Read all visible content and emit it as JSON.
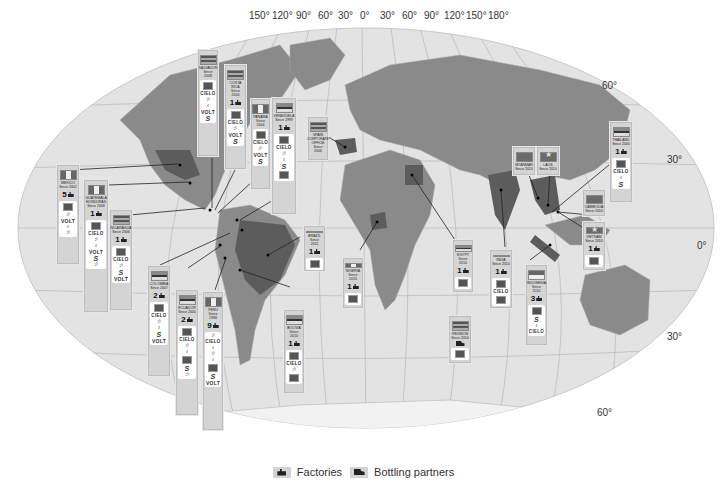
{
  "map": {
    "projection": "world-oval",
    "longitude_labels_top": [
      "150°",
      "120°",
      "90°",
      "60°",
      "30°",
      "0°",
      "30°",
      "60°",
      "90°",
      "120°",
      "150°",
      "180°"
    ],
    "latitude_labels_right": [
      "60°",
      "30°",
      "0°",
      "30°",
      "60°"
    ],
    "colors": {
      "ocean": "#e3e3e3",
      "land": "#8a8a8a",
      "highlight_land": "#5c5c5c",
      "card_bg": "#d4d4d4",
      "graticule": "#b8b8b8"
    }
  },
  "countries": [
    {
      "id": "salvador",
      "name": "SALVADOR",
      "since": "Since 2008",
      "count": "",
      "brands": [
        "logo",
        "CIELO",
        "script",
        "script",
        "VOLT",
        "S",
        "script"
      ]
    },
    {
      "id": "costa-rica",
      "name": "COSTA RICA",
      "since": "Since 2004",
      "count": "1",
      "brands": [
        "logo",
        "CIELO",
        "script",
        "script",
        "VOLT",
        "S"
      ]
    },
    {
      "id": "panama",
      "name": "PANAMA",
      "since": "Since 2004",
      "count": "",
      "brands": [
        "logo",
        "CIELO",
        "script",
        "script",
        "VOLT",
        "S"
      ]
    },
    {
      "id": "venezuela",
      "name": "VENEZUELA",
      "since": "Since 1999",
      "count": "1",
      "brands": [
        "logo",
        "CIELO",
        "script",
        "script",
        "script",
        "S",
        "box"
      ]
    },
    {
      "id": "spain",
      "name": "SPAIN Corporate office",
      "since": "Since 2006",
      "count": "",
      "brands": []
    },
    {
      "id": "mexico",
      "name": "MEXICO",
      "since": "Since 2002",
      "count": "5",
      "brands": [
        "logo",
        "script",
        "VOLT",
        "script",
        "script"
      ]
    },
    {
      "id": "guatemala-honduras",
      "name": "GUATEMALA HONDURAS",
      "since": "Since 2008",
      "count": "1",
      "brands": [
        "logo",
        "CIELO",
        "script",
        "script",
        "VOLT",
        "S",
        "script"
      ]
    },
    {
      "id": "nicaragua",
      "name": "NICARAGUA",
      "since": "Since 2006",
      "count": "1",
      "brands": [
        "logo",
        "CIELO",
        "script",
        "script",
        "S",
        "VOLT"
      ]
    },
    {
      "id": "colombia",
      "name": "COLOMBIA",
      "since": "Since 2007",
      "count": "2",
      "brands": [
        "logo",
        "CIELO",
        "script",
        "script",
        "S",
        "VOLT"
      ]
    },
    {
      "id": "ecuador",
      "name": "ECUADOR",
      "since": "Since 2000",
      "count": "2",
      "brands": [
        "logo",
        "CIELO",
        "script",
        "script",
        "box",
        "S",
        "script"
      ]
    },
    {
      "id": "peru",
      "name": "PERU",
      "since": "Since 1988",
      "count": "9",
      "brands": [
        "script",
        "CIELO",
        "script",
        "script",
        "script",
        "box",
        "S",
        "VOLT"
      ]
    },
    {
      "id": "brazil",
      "name": "BRAZIL",
      "since": "Since 2011",
      "count": "1",
      "brands": [
        "logo"
      ]
    },
    {
      "id": "bolivia",
      "name": "BOLIVIA",
      "since": "Since 2010",
      "count": "1",
      "brands": [
        "logo",
        "CIELO",
        "script",
        "script",
        "box"
      ]
    },
    {
      "id": "nigeria",
      "name": "NIGERIA",
      "since": "Since 2010",
      "count": "1",
      "brands": [
        "logo"
      ]
    },
    {
      "id": "egypt",
      "name": "EGYPT",
      "since": "Since 2010",
      "count": "1",
      "brands": [
        "logo"
      ]
    },
    {
      "id": "reunion",
      "name": "REUNION",
      "since": "Since 2010",
      "count": "truck",
      "brands": [
        "logo"
      ]
    },
    {
      "id": "india",
      "name": "INDIA",
      "since": "Since 2010",
      "count": "1",
      "brands": [
        "logo",
        "CIELO",
        "box"
      ]
    },
    {
      "id": "indonesia",
      "name": "INDONESIA",
      "since": "Since 2010",
      "count": "3",
      "brands": [
        "logo",
        "S",
        "box",
        "script",
        "CIELO"
      ]
    },
    {
      "id": "myanmar",
      "name": "MYANMAR",
      "since": "Since 2010",
      "count": "",
      "brands": []
    },
    {
      "id": "laos",
      "name": "LAOS",
      "since": "Since 2010",
      "count": "",
      "brands": []
    },
    {
      "id": "thailand",
      "name": "THAILAND",
      "since": "Since 2000",
      "count": "1",
      "brands": [
        "logo",
        "CIELO",
        "script",
        "script",
        "S"
      ]
    },
    {
      "id": "cambodia",
      "name": "CAMBODIA",
      "since": "Since 2010",
      "count": "",
      "brands": []
    },
    {
      "id": "vietnam",
      "name": "VIETNAM",
      "since": "Since 2010",
      "count": "1",
      "brands": [
        "logo"
      ]
    }
  ],
  "legend": {
    "factories_label": "Factories",
    "factories_icon": "factory-icon",
    "bottling_label": "Bottling partners",
    "bottling_icon": "truck-icon"
  }
}
